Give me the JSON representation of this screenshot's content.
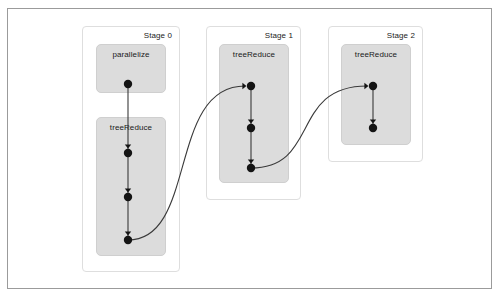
{
  "diagram": {
    "type": "dag-visualization",
    "frame": {
      "x": 7,
      "y": 8,
      "width": 485,
      "height": 281
    },
    "stages": [
      {
        "id": "stage-0",
        "label": "Stage 0",
        "panel": {
          "x": 82,
          "y": 26,
          "width": 98,
          "height": 246
        },
        "boxes": [
          {
            "id": "parallelize-box",
            "label": "parallelize",
            "rect": {
              "x": 96,
              "y": 44,
              "width": 70,
              "height": 49
            },
            "nodes": [
              {
                "cx": 128,
                "cy": 84,
                "r": 4.2
              }
            ]
          },
          {
            "id": "treereduce-box-stage0",
            "label": "treeReduce",
            "rect": {
              "x": 96,
              "y": 117,
              "width": 70,
              "height": 139
            },
            "nodes": [
              {
                "cx": 128,
                "cy": 153,
                "r": 4.2
              },
              {
                "cx": 128,
                "cy": 197,
                "r": 4.2
              },
              {
                "cx": 128,
                "cy": 240,
                "r": 4.2
              }
            ]
          }
        ]
      },
      {
        "id": "stage-1",
        "label": "Stage 1",
        "panel": {
          "x": 206,
          "y": 26,
          "width": 95,
          "height": 174
        },
        "boxes": [
          {
            "id": "treereduce-box-stage1",
            "label": "treeReduce",
            "rect": {
              "x": 219,
              "y": 44,
              "width": 70,
              "height": 139
            },
            "nodes": [
              {
                "cx": 251,
                "cy": 86,
                "r": 4.2
              },
              {
                "cx": 251,
                "cy": 128,
                "r": 4.2
              },
              {
                "cx": 251,
                "cy": 168,
                "r": 4.2
              }
            ]
          }
        ]
      },
      {
        "id": "stage-2",
        "label": "Stage 2",
        "panel": {
          "x": 328,
          "y": 26,
          "width": 95,
          "height": 136
        },
        "boxes": [
          {
            "id": "treereduce-box-stage2",
            "label": "treeReduce",
            "rect": {
              "x": 341,
              "y": 44,
              "width": 70,
              "height": 101
            },
            "nodes": [
              {
                "cx": 373,
                "cy": 86,
                "r": 4.2
              },
              {
                "cx": 373,
                "cy": 128,
                "r": 4.2
              }
            ]
          }
        ]
      }
    ],
    "edges": [
      {
        "id": "edge-s0-n1-n2",
        "kind": "straight",
        "from": [
          128,
          84
        ],
        "to": [
          128,
          153
        ]
      },
      {
        "id": "edge-s0-n2-n3",
        "kind": "straight",
        "from": [
          128,
          153
        ],
        "to": [
          128,
          197
        ]
      },
      {
        "id": "edge-s0-n3-n4",
        "kind": "straight",
        "from": [
          128,
          197
        ],
        "to": [
          128,
          240
        ]
      },
      {
        "id": "edge-s1-n1-n2",
        "kind": "straight",
        "from": [
          251,
          86
        ],
        "to": [
          251,
          128
        ]
      },
      {
        "id": "edge-s1-n2-n3",
        "kind": "straight",
        "from": [
          251,
          128
        ],
        "to": [
          251,
          168
        ]
      },
      {
        "id": "edge-s2-n1-n2",
        "kind": "straight",
        "from": [
          373,
          86
        ],
        "to": [
          373,
          128
        ]
      },
      {
        "id": "edge-stage0-to-stage1",
        "kind": "curve",
        "from": [
          128,
          240
        ],
        "to": [
          251,
          86
        ]
      },
      {
        "id": "edge-stage1-to-stage2",
        "kind": "curve",
        "from": [
          251,
          168
        ],
        "to": [
          373,
          86
        ]
      }
    ]
  },
  "colors": {
    "frame_border": "#9b9b9b",
    "stage_panel_border": "#dedede",
    "op_box_fill": "#dcdcdc",
    "op_box_border": "#cfcfcf",
    "node_fill": "#141414",
    "edge_stroke": "#3a3a3a",
    "background": "#ffffff",
    "text": "#1a1a1a"
  }
}
